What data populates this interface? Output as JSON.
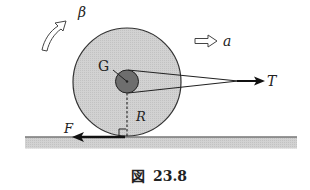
{
  "diagram": {
    "labels": {
      "center": "G",
      "radius": "R",
      "tension": "T",
      "friction": "F",
      "acceleration": "a",
      "angular_acceleration": "β"
    },
    "caption": {
      "prefix": "図",
      "number": "23.8"
    },
    "colors": {
      "disk_fill": "#cfcfcf",
      "hub_fill": "#6e6e6e",
      "ground_fill": "#c8c8c8",
      "stroke": "#222222"
    },
    "icons": {
      "rotation_arrow": "curved-hollow-arrow",
      "acceleration_arrow": "hollow-right-arrow"
    }
  }
}
